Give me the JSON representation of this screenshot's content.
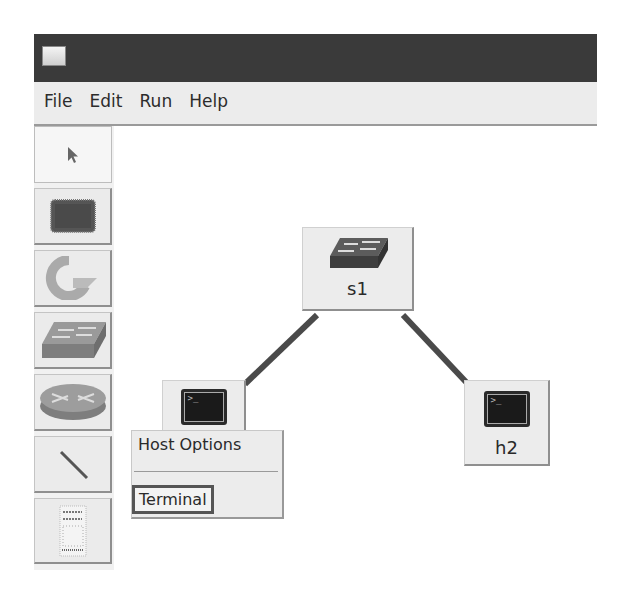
{
  "window": {
    "icon": "app-window-icon"
  },
  "menubar": {
    "items": [
      "File",
      "Edit",
      "Run",
      "Help"
    ]
  },
  "toolbar": {
    "tools": [
      {
        "name": "select",
        "icon": "pointer-arrow-icon",
        "selected": true
      },
      {
        "name": "host",
        "icon": "host-terminal-icon"
      },
      {
        "name": "controller",
        "icon": "controller-icon"
      },
      {
        "name": "switch",
        "icon": "switch-icon"
      },
      {
        "name": "router",
        "icon": "router-icon"
      },
      {
        "name": "link",
        "icon": "link-line-icon"
      },
      {
        "name": "netlink",
        "icon": "netlink-panel-icon"
      }
    ]
  },
  "canvas": {
    "nodes": [
      {
        "id": "s1",
        "label": "s1",
        "type": "switch"
      },
      {
        "id": "h1",
        "label": "",
        "type": "host"
      },
      {
        "id": "h2",
        "label": "h2",
        "type": "host"
      }
    ],
    "links": [
      {
        "from": "s1",
        "to": "h1"
      },
      {
        "from": "s1",
        "to": "h2"
      }
    ],
    "link_color": "#4a4a4a"
  },
  "context_menu": {
    "title": "Host Options",
    "items": [
      "Terminal"
    ]
  }
}
